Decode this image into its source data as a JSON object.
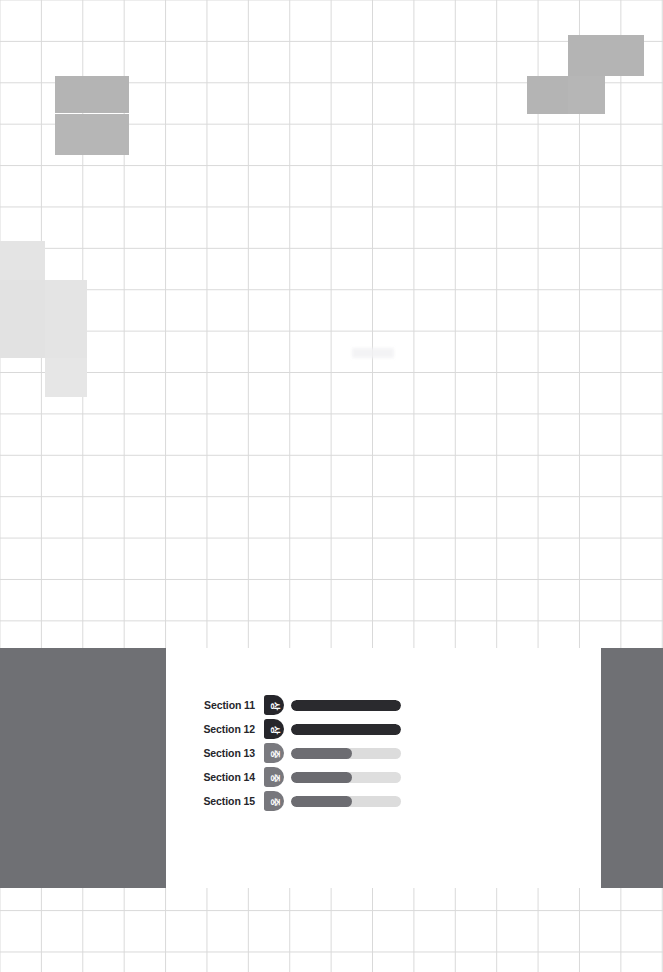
{
  "page": {
    "width": 663,
    "height": 972,
    "background_color": "#ffffff"
  },
  "grid": {
    "cell_size": 41.4,
    "line_color": "#d9d9d9"
  },
  "heatmap": {
    "colors": {
      "medium": "#b4b4b4",
      "light": "#e4e4e4"
    },
    "cells": [
      {
        "name": "cell-top-left-a",
        "x": 55,
        "y": 76,
        "w": 37,
        "h": 37,
        "color": "#b4b4b4"
      },
      {
        "name": "cell-top-left-b",
        "x": 92,
        "y": 76,
        "w": 37,
        "h": 37,
        "color": "#b4b4b4"
      },
      {
        "name": "cell-top-left-c",
        "x": 55,
        "y": 114,
        "w": 37,
        "h": 41,
        "color": "#b6b6b6"
      },
      {
        "name": "cell-top-left-d",
        "x": 92,
        "y": 114,
        "w": 37,
        "h": 41,
        "color": "#b6b6b6"
      },
      {
        "name": "cell-top-right-a",
        "x": 568,
        "y": 35,
        "w": 37,
        "h": 41,
        "color": "#b4b4b4"
      },
      {
        "name": "cell-top-right-b",
        "x": 605,
        "y": 35,
        "w": 39,
        "h": 41,
        "color": "#b4b4b4"
      },
      {
        "name": "cell-top-right-c",
        "x": 527,
        "y": 76,
        "w": 41,
        "h": 38,
        "color": "#b4b4b4"
      },
      {
        "name": "cell-top-right-d",
        "x": 568,
        "y": 76,
        "w": 37,
        "h": 38,
        "color": "#b6b6b6"
      },
      {
        "name": "cell-mid-left-a",
        "x": 0,
        "y": 241,
        "w": 45,
        "h": 39,
        "color": "#e4e4e4"
      },
      {
        "name": "cell-mid-left-b",
        "x": 0,
        "y": 280,
        "w": 45,
        "h": 39,
        "color": "#e2e2e2"
      },
      {
        "name": "cell-mid-left-c",
        "x": 45,
        "y": 280,
        "w": 42,
        "h": 39,
        "color": "#e4e4e4"
      },
      {
        "name": "cell-mid-left-d",
        "x": 0,
        "y": 319,
        "w": 45,
        "h": 39,
        "color": "#e2e2e2"
      },
      {
        "name": "cell-mid-left-e",
        "x": 45,
        "y": 319,
        "w": 42,
        "h": 39,
        "color": "#e4e4e4"
      },
      {
        "name": "cell-mid-left-f",
        "x": 45,
        "y": 358,
        "w": 42,
        "h": 39,
        "color": "#e6e6e6"
      }
    ]
  },
  "band": {
    "color": "#6f7074",
    "top": 648,
    "height": 240
  },
  "card": {
    "background_color": "#ffffff",
    "left": 166,
    "top": 648,
    "width": 435,
    "height": 240
  },
  "legend": {
    "level_high_label": "상",
    "level_medium_label": "중",
    "level_high_color": "#26262b",
    "level_medium_color": "#77777c",
    "bar_fill_dark": "#2a2a2e",
    "bar_fill_gray": "#6d6d72",
    "bar_track_color": "#dcdcdc"
  },
  "chart_data": {
    "type": "bar",
    "title": "",
    "xlabel": "",
    "ylabel": "",
    "orientation": "horizontal",
    "xlim": [
      0,
      100
    ],
    "grid": false,
    "legend": "none",
    "categories": [
      "Section 11",
      "Section 12",
      "Section 13",
      "Section 14",
      "Section 15"
    ],
    "values": [
      100,
      100,
      55,
      55,
      55
    ],
    "levels": [
      "상",
      "상",
      "중",
      "중",
      "중"
    ],
    "rows": [
      {
        "label": "Section 11",
        "level": "상",
        "level_name": "high",
        "value": 100,
        "badge_color": "#26262b",
        "fill_color": "#2a2a2e",
        "track_color": "#dcdcdc"
      },
      {
        "label": "Section 12",
        "level": "상",
        "level_name": "high",
        "value": 100,
        "badge_color": "#26262b",
        "fill_color": "#2a2a2e",
        "track_color": "#dcdcdc"
      },
      {
        "label": "Section 13",
        "level": "중",
        "level_name": "medium",
        "value": 55,
        "badge_color": "#7a7a7f",
        "fill_color": "#6d6d72",
        "track_color": "#dcdcdc"
      },
      {
        "label": "Section 14",
        "level": "중",
        "level_name": "medium",
        "value": 55,
        "badge_color": "#78787d",
        "fill_color": "#6b6b70",
        "track_color": "#dedede"
      },
      {
        "label": "Section 15",
        "level": "중",
        "level_name": "medium",
        "value": 55,
        "badge_color": "#77777c",
        "fill_color": "#6c6c71",
        "track_color": "#dcdcdc"
      }
    ]
  }
}
